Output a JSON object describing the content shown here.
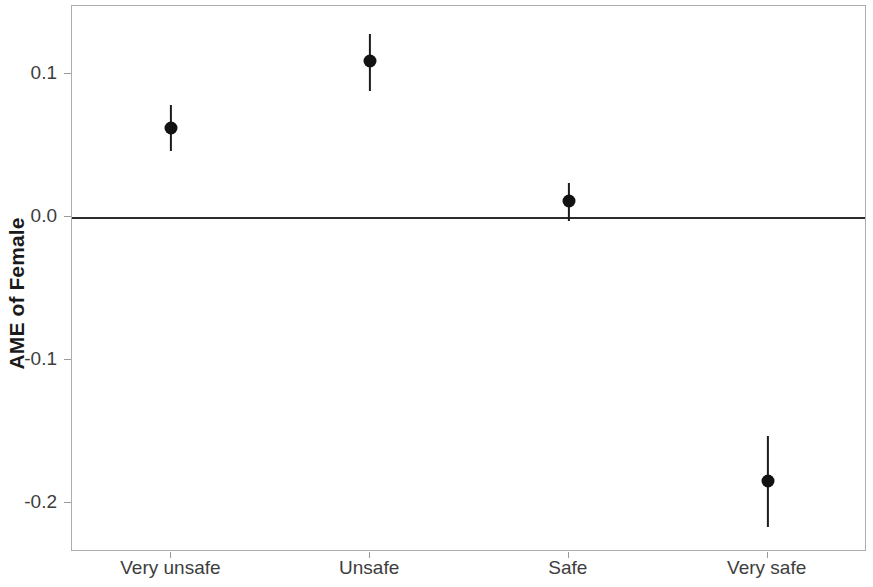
{
  "axis": {
    "y_title": "AME of Female",
    "y_tick_labels": [
      "0.1",
      "0.0",
      "-0.1",
      "-0.2"
    ],
    "x_tick_labels": [
      "Very unsafe",
      "Unsafe",
      "Safe",
      "Very safe"
    ]
  },
  "style": {
    "point_color": "#121212",
    "errorbar_color": "#1c1c1c",
    "zero_line_color": "#2b2b2b",
    "panel_border_color": "#adadad",
    "background_color": "#ffffff",
    "tick_text_color": "#3d3d3d",
    "axis_title_color": "#1a1a1a"
  },
  "chart_data": {
    "type": "scatter",
    "title": "",
    "subtitle": "",
    "xlabel": "",
    "ylabel": "AME of Female",
    "categories": [
      "Very unsafe",
      "Unsafe",
      "Safe",
      "Very safe"
    ],
    "values": [
      0.062,
      0.109,
      0.011,
      -0.185
    ],
    "ci_low": [
      0.046,
      0.088,
      -0.003,
      -0.217
    ],
    "ci_high": [
      0.078,
      0.128,
      0.024,
      -0.153
    ],
    "yticks": [
      0.1,
      0.0,
      -0.1,
      -0.2
    ],
    "ylim": [
      -0.2345,
      0.1475
    ],
    "xlim": [
      0.5,
      4.5
    ],
    "grid": false,
    "legend": false,
    "legend_position": "none",
    "annotations": [
      {
        "type": "hline",
        "y": 0.0,
        "label": "zero reference line"
      }
    ],
    "series": [
      {
        "name": "AME of Female",
        "points": [
          {
            "category": "Very unsafe",
            "value": 0.062,
            "ci_low": 0.046,
            "ci_high": 0.078
          },
          {
            "category": "Unsafe",
            "value": 0.109,
            "ci_low": 0.088,
            "ci_high": 0.128
          },
          {
            "category": "Safe",
            "value": 0.011,
            "ci_low": -0.003,
            "ci_high": 0.024
          },
          {
            "category": "Very safe",
            "value": -0.185,
            "ci_low": -0.217,
            "ci_high": -0.153
          }
        ]
      }
    ]
  }
}
